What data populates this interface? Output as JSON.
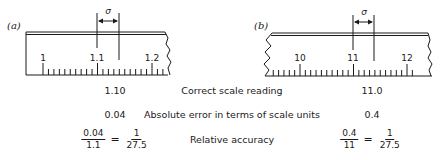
{
  "panels": [
    {
      "id": "a",
      "label": "(a)",
      "major_labels": [
        "1",
        "1.1",
        "1.2"
      ],
      "sigma_label": "σ"
    },
    {
      "id": "b",
      "label": "(b)",
      "major_labels": [
        "10",
        "11",
        "12"
      ],
      "sigma_label": "σ"
    }
  ],
  "table": {
    "rows": [
      {
        "left": "1.10",
        "middle": "Correct scale reading",
        "right": "11.0"
      },
      {
        "left": "0.04",
        "middle": "Absolute error in terms of scale units",
        "right": "0.4"
      },
      {
        "middle": "Relative accuracy"
      }
    ],
    "left_fraction": {
      "num1": "0.04",
      "den1": "1.1",
      "eq": "=",
      "num2": "1",
      "den2": "27.5"
    },
    "right_fraction": {
      "num1": "0.4",
      "den1": "11",
      "eq": "=",
      "num2": "1",
      "den2": "27.5"
    }
  },
  "colors": {
    "ink": "#1a1a1a",
    "background": "#ffffff"
  }
}
